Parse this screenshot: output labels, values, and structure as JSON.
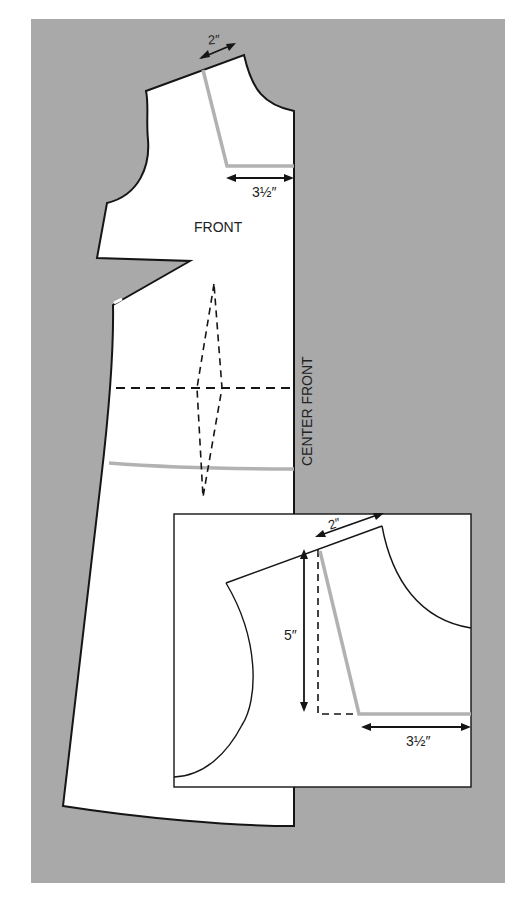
{
  "figure": {
    "background_color": "#a9a9a9",
    "pattern_fill": "#ffffff",
    "alteration_line_color": "#b2b2b2"
  },
  "main_piece": {
    "label": "FRONT",
    "center_front_label": "CENTER FRONT",
    "measurements": {
      "shoulder_width": "2″",
      "neckline_depth_offset": "3½″"
    }
  },
  "inset_detail": {
    "measurements": {
      "shoulder_width": "2″",
      "vertical_drop": "5″",
      "horizontal_offset": "3½″"
    }
  },
  "icons": {
    "arrow": "double-headed-arrow"
  }
}
